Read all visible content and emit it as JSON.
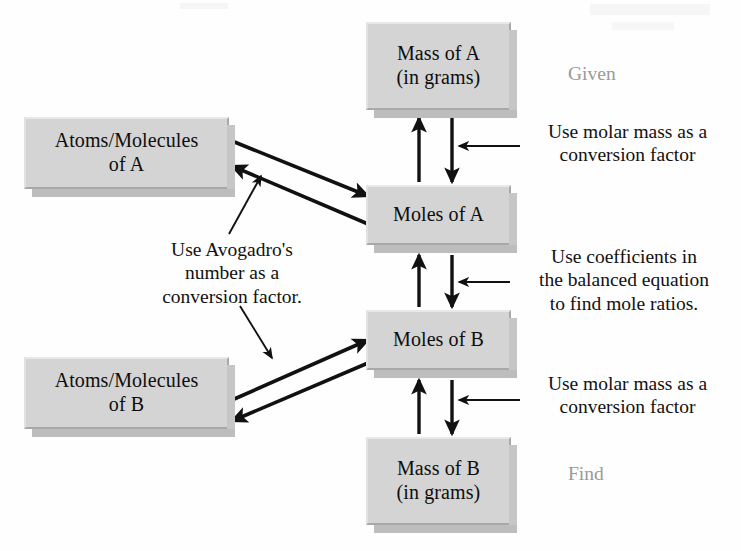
{
  "diagram": {
    "colors": {
      "box_fill": "#d4d4d4",
      "box_shadow": "#bdbdbd",
      "arrow": "#111111",
      "muted_text": "#9a9a9a",
      "body_text": "#0d0d0d",
      "background": "#fefefe"
    },
    "nodes": [
      {
        "id": "mass-a",
        "label": "Mass of A\n(in grams)",
        "x": 366,
        "y": 22,
        "w": 145,
        "h": 88
      },
      {
        "id": "moles-a",
        "label": "Moles of A",
        "x": 366,
        "y": 185,
        "w": 145,
        "h": 60
      },
      {
        "id": "moles-b",
        "label": "Moles of B",
        "x": 366,
        "y": 310,
        "w": 145,
        "h": 60
      },
      {
        "id": "mass-b",
        "label": "Mass of B\n(in grams)",
        "x": 366,
        "y": 437,
        "w": 145,
        "h": 88
      },
      {
        "id": "atoms-a",
        "label": "Atoms/Molecules\nof A",
        "x": 24,
        "y": 117,
        "w": 205,
        "h": 72
      },
      {
        "id": "atoms-b",
        "label": "Atoms/Molecules\nof B",
        "x": 24,
        "y": 357,
        "w": 205,
        "h": 72
      }
    ],
    "annotations": [
      {
        "id": "given",
        "text": "Given",
        "style": "muted",
        "x": 568,
        "y": 62
      },
      {
        "id": "find",
        "text": "Find",
        "style": "muted",
        "x": 568,
        "y": 462
      },
      {
        "id": "molar-mass-top",
        "text": "Use molar mass as a\nconversion factor",
        "style": "normal",
        "x": 520,
        "y": 120,
        "w": 215
      },
      {
        "id": "coefficients",
        "text": "Use coefficients in\nthe balanced equation\nto find mole ratios.",
        "style": "normal",
        "x": 510,
        "y": 245,
        "w": 228
      },
      {
        "id": "molar-mass-bot",
        "text": "Use molar mass as a\nconversion factor",
        "style": "normal",
        "x": 520,
        "y": 372,
        "w": 215
      },
      {
        "id": "avogadro",
        "text": "Use Avogadro's\nnumber as a\nconversion factor.",
        "style": "normal",
        "x": 124,
        "y": 238,
        "w": 216
      }
    ],
    "edges": [
      {
        "id": "mass-a-to-moles-a",
        "type": "vertical-pair",
        "between": [
          "mass-a",
          "moles-a"
        ]
      },
      {
        "id": "moles-a-to-moles-b",
        "type": "vertical-pair",
        "between": [
          "moles-a",
          "moles-b"
        ]
      },
      {
        "id": "moles-b-to-mass-b",
        "type": "vertical-pair",
        "between": [
          "moles-b",
          "mass-b"
        ]
      },
      {
        "id": "atoms-a-to-moles-a",
        "type": "diagonal-pair",
        "between": [
          "atoms-a",
          "moles-a"
        ]
      },
      {
        "id": "atoms-b-to-moles-b",
        "type": "diagonal-pair",
        "between": [
          "atoms-b",
          "moles-b"
        ]
      },
      {
        "id": "pointer-molar-top",
        "type": "pointer",
        "target": "mass-a-to-moles-a"
      },
      {
        "id": "pointer-coefficients",
        "type": "pointer",
        "target": "moles-a-to-moles-b"
      },
      {
        "id": "pointer-molar-bot",
        "type": "pointer",
        "target": "moles-b-to-mass-b"
      },
      {
        "id": "pointer-avogadro-up",
        "type": "pointer",
        "target": "atoms-a-to-moles-a"
      },
      {
        "id": "pointer-avogadro-down",
        "type": "pointer",
        "target": "atoms-b-to-moles-b"
      }
    ]
  }
}
